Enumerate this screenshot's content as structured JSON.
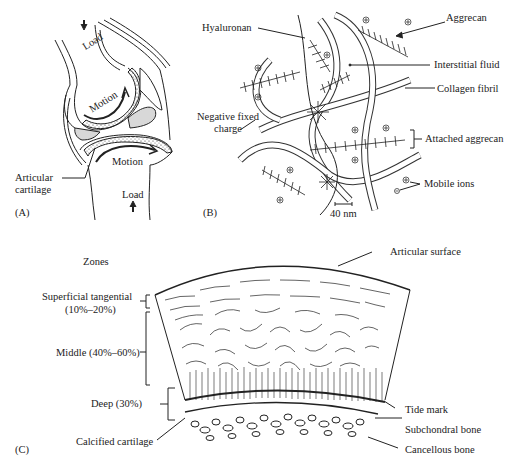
{
  "panel_a": {
    "label": "(A)",
    "load_top": "Load",
    "load_bottom": "Load",
    "motion_top": "Motion",
    "motion_bottom": "Motion",
    "articular_cartilage_line1": "Articular",
    "articular_cartilage_line2": "cartilage"
  },
  "panel_b": {
    "label": "(B)",
    "hyaluronan": "Hyaluronan",
    "aggrecan": "Aggrecan",
    "interstitial_fluid": "Interstitial fluid",
    "collagen_fibril": "Collagen fibril",
    "negative_fixed_charge_line1": "Negative fixed",
    "negative_fixed_charge_line2": "charge",
    "attached_aggrecan": "Attached aggrecan",
    "mobile_ions": "Mobile ions",
    "scale_bar": "40 nm"
  },
  "panel_c": {
    "label": "(C)",
    "zones_title": "Zones",
    "superficial_line1": "Superficial tangential",
    "superficial_line2": "(10%–20%)",
    "middle": "Middle (40%–60%)",
    "deep": "Deep (30%)",
    "calcified_cartilage": "Calcified cartilage",
    "articular_surface": "Articular surface",
    "tide_mark": "Tide mark",
    "subchondral_bone": "Subchondral bone",
    "cancellous_bone": "Cancellous bone"
  },
  "colors": {
    "line": "#222222",
    "meniscus_fill": "#d8d8d8",
    "background": "#ffffff"
  }
}
